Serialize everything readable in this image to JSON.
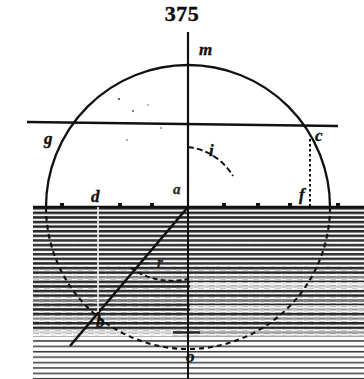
{
  "figure": {
    "number": "375",
    "caption_position": "top-center"
  },
  "labels": [
    {
      "id": "m",
      "text": "m",
      "x": 199,
      "y": 41,
      "role": "normal-line-label"
    },
    {
      "id": "g",
      "text": "g",
      "x": 44,
      "y": 130,
      "role": "point-label"
    },
    {
      "id": "c",
      "text": "c",
      "x": 315,
      "y": 127,
      "role": "point-label"
    },
    {
      "id": "i",
      "text": "i",
      "x": 209,
      "y": 142,
      "role": "angle-label"
    },
    {
      "id": "a",
      "text": "a",
      "x": 173,
      "y": 182,
      "role": "center-point-label"
    },
    {
      "id": "d",
      "text": "d",
      "x": 91,
      "y": 188,
      "role": "point-label"
    },
    {
      "id": "f",
      "text": "f",
      "x": 299,
      "y": 186,
      "role": "point-label"
    },
    {
      "id": "r",
      "text": "r",
      "x": 157,
      "y": 255,
      "role": "angle-label"
    },
    {
      "id": "b",
      "text": "b",
      "x": 96,
      "y": 313,
      "role": "point-label"
    },
    {
      "id": "o",
      "text": "o",
      "x": 186,
      "y": 348,
      "role": "point-label"
    }
  ],
  "geometry": {
    "circle": {
      "cx": 188,
      "cy": 207,
      "r": 142
    },
    "center_point": {
      "x": 188,
      "y": 207,
      "name": "a"
    },
    "normal_line": {
      "x1": 188,
      "y1": 32,
      "x2": 188,
      "y2": 379,
      "name": "m-o"
    },
    "surface_line": {
      "x1": 33,
      "y1": 207,
      "x2": 364,
      "y2": 207
    },
    "incident_ray": {
      "x1": 27,
      "y1": 123,
      "x2": 336,
      "y2": 126,
      "through": [
        "g",
        "a",
        "c"
      ]
    },
    "refracted_ray": {
      "x1": 188,
      "y1": 207,
      "x2": 72,
      "y2": 344,
      "through": [
        "a",
        "b"
      ]
    },
    "point_g": {
      "x": 58,
      "y": 140
    },
    "point_c": {
      "x": 310,
      "y": 139
    },
    "point_d": {
      "x": 98,
      "y": 207
    },
    "point_f": {
      "x": 310,
      "y": 207
    },
    "point_b": {
      "x": 88,
      "y": 327
    },
    "point_o": {
      "x": 188,
      "y": 349
    },
    "drop_line_c_f": {
      "x": 310,
      "y1": 140,
      "y2": 207,
      "style": "dotted"
    },
    "drop_line_d": {
      "x": 98,
      "y1": 207,
      "y2": 310,
      "style": "light"
    },
    "angle_arc_i": {
      "label": "i",
      "between": [
        "normal",
        "ray-ac"
      ]
    },
    "angle_arc_r": {
      "label": "r",
      "between": [
        "normal-down",
        "ray-ab"
      ]
    }
  },
  "colors": {
    "ink": "#111111",
    "paper": "#ffffff",
    "hatch": "#2b2b2b"
  },
  "description": {
    "medium_upper": "air (blank, above surface line)",
    "medium_lower": "denser medium (horizontally hatched, below surface line)"
  }
}
